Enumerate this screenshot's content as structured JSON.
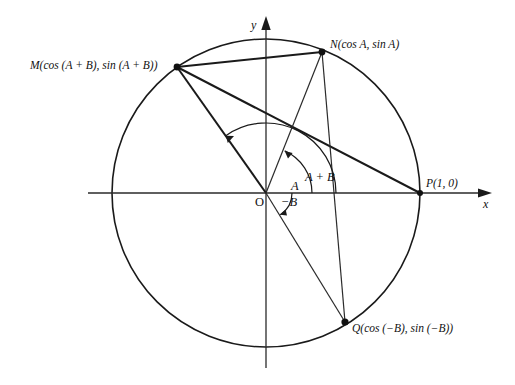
{
  "figure": {
    "type": "geometry-diagram",
    "width": 515,
    "height": 385,
    "background_color": "#ffffff",
    "stroke_color": "#1a1a1a"
  },
  "axes": {
    "x_label": "x",
    "y_label": "y",
    "origin_label": "O",
    "x_axis": {
      "x1": 88,
      "y1": 193,
      "x2": 492,
      "y2": 193,
      "arrow": "right"
    },
    "y_axis": {
      "x1": 266,
      "y1": 368,
      "x2": 266,
      "y2": 16,
      "arrow": "up"
    }
  },
  "circle": {
    "cx": 266,
    "cy": 193,
    "r": 154,
    "description": "unit circle"
  },
  "points": [
    {
      "id": "M",
      "label": "M(cos (A + B),  sin (A + B))",
      "x": 177,
      "y": 67,
      "label_x": 30,
      "label_y": 60,
      "angle_deg": 125
    },
    {
      "id": "N",
      "label": "N(cos A, sin A)",
      "x": 322,
      "y": 52,
      "label_x": 330,
      "label_y": 39,
      "angle_deg": 66
    },
    {
      "id": "P",
      "label": "P(1, 0)",
      "x": 420,
      "y": 193,
      "label_x": 426,
      "label_y": 178,
      "angle_deg": 0
    },
    {
      "id": "Q",
      "label": "Q(cos (−B), sin (−B))",
      "x": 345,
      "y": 322,
      "label_x": 352,
      "label_y": 323,
      "angle_deg": -57
    }
  ],
  "segments": [
    {
      "name": "chord-M-P",
      "from": "M",
      "to": "P",
      "weight": "thick"
    },
    {
      "name": "chord-M-N",
      "from": "M",
      "to": "N",
      "weight": "thick"
    },
    {
      "name": "radius-O-M",
      "from": "O",
      "to": "M",
      "weight": "thick"
    },
    {
      "name": "radius-O-N",
      "from": "O",
      "to": "N",
      "weight": "thin"
    },
    {
      "name": "radius-O-Q",
      "from": "O",
      "to": "Q",
      "weight": "thin"
    },
    {
      "name": "chord-N-Q",
      "from": "N",
      "to": "Q",
      "weight": "thin"
    }
  ],
  "angles": [
    {
      "id": "A",
      "label": "A",
      "label_x": 291,
      "label_y": 180,
      "radius": 46,
      "start_deg": 0,
      "end_deg": 66,
      "direction": "counterclockwise"
    },
    {
      "id": "A+B",
      "label": "A + B",
      "label_x": 305,
      "label_y": 171,
      "radius": 70,
      "start_deg": 0,
      "end_deg": 125,
      "direction": "counterclockwise"
    },
    {
      "id": "-B",
      "label": "−B",
      "label_x": 281,
      "label_y": 196,
      "radius": 26,
      "start_deg": 0,
      "end_deg": -57,
      "direction": "clockwise"
    }
  ]
}
